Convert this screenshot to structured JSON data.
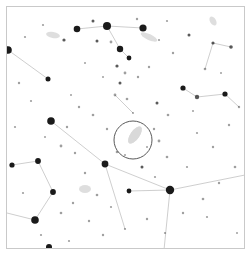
{
  "chart": {
    "type": "star-chart",
    "title": "",
    "background_color": "#ffffff",
    "frame": {
      "x": 6,
      "y": 6,
      "width": 239,
      "height": 243,
      "border_color": "#c9c9c9",
      "border_width": 1
    },
    "star_color": "#1a1a1a",
    "line_color": "#c8c8c8",
    "nebula_color": "#d8d8d8",
    "marker_color": "#5a5a5a"
  },
  "chart_data": {
    "type": "scatter",
    "title": "",
    "xlabel": "",
    "ylabel": "",
    "xlim": [
      0,
      239
    ],
    "ylim": [
      0,
      243
    ],
    "grid": false,
    "legend": "none",
    "note": "Star field finder chart. Point size encodes stellar magnitude (r = radius in px at chart scale); x,y are pixel positions inside the framed sky area.",
    "fov_marker": {
      "shape": "circle",
      "cx": 126,
      "cy": 133,
      "r": 19,
      "stroke": "#5a5a5a",
      "stroke_width": 1,
      "label": ""
    },
    "target_object": {
      "shape": "ellipse",
      "cx": 128,
      "cy": 128,
      "rx": 4.5,
      "ry": 10,
      "rotation_deg": 35,
      "fill": "#d9d9d9",
      "label": ""
    },
    "stars": [
      {
        "x": 70,
        "y": 22,
        "r": 3.3
      },
      {
        "x": 100,
        "y": 19,
        "r": 4.0
      },
      {
        "x": 136,
        "y": 21,
        "r": 3.6
      },
      {
        "x": 113,
        "y": 42,
        "r": 3.2
      },
      {
        "x": 122,
        "y": 51,
        "r": 2.4
      },
      {
        "x": 1,
        "y": 43,
        "r": 3.8
      },
      {
        "x": 41,
        "y": 72,
        "r": 2.5
      },
      {
        "x": 44,
        "y": 114,
        "r": 3.8
      },
      {
        "x": 31,
        "y": 154,
        "r": 2.9
      },
      {
        "x": 46,
        "y": 185,
        "r": 2.9
      },
      {
        "x": 28,
        "y": 213,
        "r": 3.8
      },
      {
        "x": 42,
        "y": 240,
        "r": 3.0
      },
      {
        "x": 98,
        "y": 157,
        "r": 3.4
      },
      {
        "x": 163,
        "y": 183,
        "r": 4.2
      },
      {
        "x": 122,
        "y": 184,
        "r": 2.4
      },
      {
        "x": 5,
        "y": 158,
        "r": 2.6
      },
      {
        "x": 176,
        "y": 81,
        "r": 2.6
      },
      {
        "x": 190,
        "y": 90,
        "r": 2.2
      },
      {
        "x": 218,
        "y": 87,
        "r": 2.6
      },
      {
        "x": 224,
        "y": 40,
        "r": 1.8
      },
      {
        "x": 206,
        "y": 36,
        "r": 1.6
      },
      {
        "x": 182,
        "y": 28,
        "r": 1.5
      },
      {
        "x": 57,
        "y": 33,
        "r": 1.6
      },
      {
        "x": 86,
        "y": 14,
        "r": 1.5
      },
      {
        "x": 90,
        "y": 34,
        "r": 1.5
      },
      {
        "x": 104,
        "y": 35,
        "r": 1.4
      },
      {
        "x": 110,
        "y": 59,
        "r": 1.6
      },
      {
        "x": 118,
        "y": 66,
        "r": 1.4
      },
      {
        "x": 113,
        "y": 76,
        "r": 1.5
      },
      {
        "x": 108,
        "y": 88,
        "r": 1.4
      },
      {
        "x": 120,
        "y": 92,
        "r": 1.3
      },
      {
        "x": 131,
        "y": 70,
        "r": 1.2
      },
      {
        "x": 142,
        "y": 60,
        "r": 1.2
      },
      {
        "x": 150,
        "y": 96,
        "r": 1.5
      },
      {
        "x": 161,
        "y": 108,
        "r": 1.3
      },
      {
        "x": 147,
        "y": 122,
        "r": 1.2
      },
      {
        "x": 152,
        "y": 134,
        "r": 1.4
      },
      {
        "x": 160,
        "y": 150,
        "r": 1.3
      },
      {
        "x": 135,
        "y": 160,
        "r": 1.5
      },
      {
        "x": 110,
        "y": 145,
        "r": 1.3
      },
      {
        "x": 100,
        "y": 122,
        "r": 1.2
      },
      {
        "x": 86,
        "y": 108,
        "r": 1.3
      },
      {
        "x": 72,
        "y": 100,
        "r": 1.2
      },
      {
        "x": 60,
        "y": 120,
        "r": 1.2
      },
      {
        "x": 54,
        "y": 139,
        "r": 1.4
      },
      {
        "x": 68,
        "y": 146,
        "r": 1.2
      },
      {
        "x": 78,
        "y": 166,
        "r": 1.2
      },
      {
        "x": 90,
        "y": 188,
        "r": 1.3
      },
      {
        "x": 66,
        "y": 196,
        "r": 1.2
      },
      {
        "x": 54,
        "y": 206,
        "r": 1.3
      },
      {
        "x": 82,
        "y": 214,
        "r": 1.2
      },
      {
        "x": 96,
        "y": 228,
        "r": 1.2
      },
      {
        "x": 118,
        "y": 222,
        "r": 1.1
      },
      {
        "x": 140,
        "y": 212,
        "r": 1.2
      },
      {
        "x": 158,
        "y": 226,
        "r": 1.1
      },
      {
        "x": 176,
        "y": 206,
        "r": 1.2
      },
      {
        "x": 196,
        "y": 192,
        "r": 1.3
      },
      {
        "x": 212,
        "y": 176,
        "r": 1.2
      },
      {
        "x": 228,
        "y": 160,
        "r": 1.3
      },
      {
        "x": 206,
        "y": 140,
        "r": 1.2
      },
      {
        "x": 190,
        "y": 126,
        "r": 1.1
      },
      {
        "x": 222,
        "y": 118,
        "r": 1.2
      },
      {
        "x": 232,
        "y": 100,
        "r": 1.2
      },
      {
        "x": 198,
        "y": 62,
        "r": 1.3
      },
      {
        "x": 166,
        "y": 46,
        "r": 1.2
      },
      {
        "x": 152,
        "y": 33,
        "r": 1.1
      },
      {
        "x": 130,
        "y": 12,
        "r": 1.2
      },
      {
        "x": 160,
        "y": 14,
        "r": 1.1
      },
      {
        "x": 36,
        "y": 18,
        "r": 1.1
      },
      {
        "x": 18,
        "y": 30,
        "r": 1.1
      },
      {
        "x": 12,
        "y": 76,
        "r": 1.2
      },
      {
        "x": 24,
        "y": 94,
        "r": 1.1
      },
      {
        "x": 8,
        "y": 120,
        "r": 1.1
      },
      {
        "x": 16,
        "y": 186,
        "r": 1.1
      },
      {
        "x": 34,
        "y": 228,
        "r": 1.1
      },
      {
        "x": 62,
        "y": 234,
        "r": 1.1
      },
      {
        "x": 104,
        "y": 200,
        "r": 1.1
      },
      {
        "x": 148,
        "y": 170,
        "r": 1.1
      },
      {
        "x": 180,
        "y": 160,
        "r": 1.1
      },
      {
        "x": 200,
        "y": 210,
        "r": 1.1
      },
      {
        "x": 230,
        "y": 226,
        "r": 1.0
      },
      {
        "x": 214,
        "y": 66,
        "r": 1.0
      },
      {
        "x": 186,
        "y": 104,
        "r": 1.0
      },
      {
        "x": 96,
        "y": 70,
        "r": 1.0
      },
      {
        "x": 78,
        "y": 56,
        "r": 1.0
      },
      {
        "x": 64,
        "y": 88,
        "r": 1.0
      },
      {
        "x": 38,
        "y": 130,
        "r": 1.0
      },
      {
        "x": 126,
        "y": 106,
        "r": 1.0
      },
      {
        "x": 140,
        "y": 140,
        "r": 1.0
      },
      {
        "x": 118,
        "y": 148,
        "r": 1.0
      }
    ],
    "constellation_lines": [
      {
        "x1": 70,
        "y1": 22,
        "x2": 100,
        "y2": 19
      },
      {
        "x1": 100,
        "y1": 19,
        "x2": 113,
        "y2": 42
      },
      {
        "x1": 113,
        "y1": 42,
        "x2": 122,
        "y2": 51
      },
      {
        "x1": 100,
        "y1": 19,
        "x2": 136,
        "y2": 21
      },
      {
        "x1": 1,
        "y1": 43,
        "x2": 41,
        "y2": 72
      },
      {
        "x1": 44,
        "y1": 114,
        "x2": 98,
        "y2": 157
      },
      {
        "x1": 98,
        "y1": 157,
        "x2": 163,
        "y2": 183
      },
      {
        "x1": 163,
        "y1": 183,
        "x2": 122,
        "y2": 184
      },
      {
        "x1": 163,
        "y1": 183,
        "x2": 238,
        "y2": 168
      },
      {
        "x1": 163,
        "y1": 183,
        "x2": 157,
        "y2": 243
      },
      {
        "x1": 31,
        "y1": 154,
        "x2": 46,
        "y2": 185
      },
      {
        "x1": 46,
        "y1": 185,
        "x2": 28,
        "y2": 213
      },
      {
        "x1": 28,
        "y1": 213,
        "x2": 0,
        "y2": 206
      },
      {
        "x1": 31,
        "y1": 154,
        "x2": 5,
        "y2": 158
      },
      {
        "x1": 176,
        "y1": 81,
        "x2": 190,
        "y2": 90
      },
      {
        "x1": 190,
        "y1": 90,
        "x2": 218,
        "y2": 87
      },
      {
        "x1": 218,
        "y1": 87,
        "x2": 232,
        "y2": 100
      },
      {
        "x1": 224,
        "y1": 40,
        "x2": 206,
        "y2": 36
      },
      {
        "x1": 206,
        "y1": 36,
        "x2": 198,
        "y2": 62
      },
      {
        "x1": 108,
        "y1": 88,
        "x2": 126,
        "y2": 106
      },
      {
        "x1": 98,
        "y1": 157,
        "x2": 118,
        "y2": 222
      }
    ],
    "nebulae": [
      {
        "cx": 128,
        "cy": 128,
        "rx": 4.5,
        "ry": 10,
        "rotation_deg": 35
      },
      {
        "cx": 46,
        "cy": 28,
        "rx": 7,
        "ry": 3,
        "rotation_deg": 10
      },
      {
        "cx": 142,
        "cy": 30,
        "rx": 9,
        "ry": 3,
        "rotation_deg": 25
      },
      {
        "cx": 78,
        "cy": 182,
        "rx": 6,
        "ry": 4,
        "rotation_deg": 0
      },
      {
        "cx": 206,
        "cy": 14,
        "rx": 5,
        "ry": 3,
        "rotation_deg": 60
      }
    ]
  }
}
